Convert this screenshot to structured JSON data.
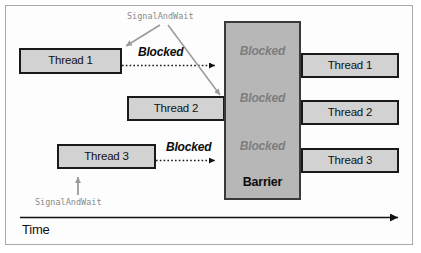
{
  "figure": {
    "colors": {
      "box_fill": "#d2d2d2",
      "box_border": "#1a1a1a",
      "barrier_fill": "#b7b7b7",
      "barrier_border": "#3a3a3a",
      "blocked_gray": "#7d7d7d",
      "blocked_black": "#0d0d0d",
      "signal_gray": "#8a8a8a",
      "frame_border": "#a8a8a8"
    }
  },
  "entry_boxes": [
    {
      "label": "Thread 1"
    },
    {
      "label": "Thread 2"
    },
    {
      "label": "Thread 3"
    }
  ],
  "exit_boxes": [
    {
      "label": "Thread 1"
    },
    {
      "label": "Thread 2"
    },
    {
      "label": "Thread 3"
    }
  ],
  "barrier": {
    "label": "Barrier",
    "blocked_labels": [
      {
        "label": "Blocked"
      },
      {
        "label": "Blocked"
      },
      {
        "label": "Blocked"
      }
    ]
  },
  "blocked_markers": [
    {
      "label": "Blocked"
    },
    {
      "label": "Blocked"
    }
  ],
  "annotations": [
    {
      "label": "SignalAndWait"
    },
    {
      "label": "SignalAndWait"
    }
  ],
  "axis": {
    "label": "Time"
  }
}
